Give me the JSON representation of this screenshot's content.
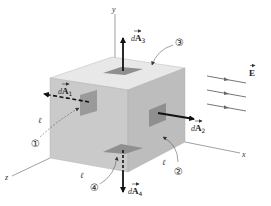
{
  "figure": {
    "axes": {
      "x": "x",
      "y": "y",
      "z": "z"
    },
    "field_label": "E",
    "edge_label": "ℓ",
    "area_vectors": [
      {
        "id": "dA1",
        "prefix": "d",
        "symbol": "A",
        "sub": "1",
        "direction": "-z (left, out of front face), dashed"
      },
      {
        "id": "dA2",
        "prefix": "d",
        "symbol": "A",
        "sub": "2",
        "direction": "+x"
      },
      {
        "id": "dA3",
        "prefix": "d",
        "symbol": "A",
        "sub": "3",
        "direction": "+y"
      },
      {
        "id": "dA4",
        "prefix": "d",
        "symbol": "A",
        "sub": "4",
        "direction": "-y"
      }
    ],
    "face_markers": [
      "①",
      "②",
      "③",
      "④"
    ],
    "field_lines_count": 3,
    "colors": {
      "top_face": "#e6e6e6",
      "front_face": "#c9c9c9",
      "right_face": "#bdbdbd",
      "patch": "#8f8f8f",
      "arrow": "#111111",
      "field_line": "#666666"
    }
  }
}
